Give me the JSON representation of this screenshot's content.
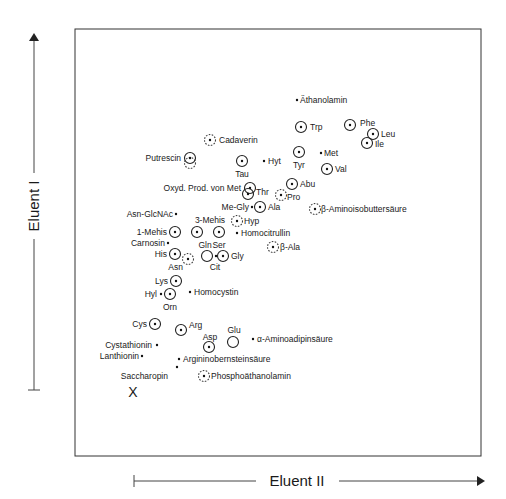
{
  "axes": {
    "y_label": "Eluent I",
    "x_label": "Eluent II"
  },
  "origin_marker": "X",
  "legend_symbols": {
    "solid-circle-dot": "circled spot (strong)",
    "dashed-circle-dot": "dashed circled spot (weak)",
    "open-circle": "open circle",
    "dot": "small dot"
  },
  "chart_data": {
    "type": "scatter",
    "title": "",
    "xlabel": "Eluent II",
    "ylabel": "Eluent I",
    "grid": false,
    "points": [
      {
        "name": "Äthanolamin",
        "x": 297,
        "y": 100,
        "marker": "dot",
        "lx": 300,
        "ly": 103,
        "anchor": "start"
      },
      {
        "name": "Trp",
        "x": 301,
        "y": 127,
        "marker": "circle-dot",
        "lx": 310,
        "ly": 130,
        "anchor": "start"
      },
      {
        "name": "Phe",
        "x": 350,
        "y": 125,
        "marker": "circle-dot",
        "lx": 360,
        "ly": 126,
        "anchor": "start"
      },
      {
        "name": "Leu",
        "x": 373,
        "y": 134,
        "marker": "circle-dot",
        "lx": 381,
        "ly": 137,
        "anchor": "start"
      },
      {
        "name": "Ile",
        "x": 367,
        "y": 143,
        "marker": "circle-dot",
        "lx": 375,
        "ly": 147,
        "anchor": "start"
      },
      {
        "name": "Cadaverin",
        "x": 210,
        "y": 140,
        "marker": "dashed-circle-dot",
        "lx": 219,
        "ly": 143,
        "anchor": "start"
      },
      {
        "name": "Putrescin",
        "x": 190,
        "y": 158,
        "marker": "circle-dot",
        "lx": 181,
        "ly": 161,
        "anchor": "end"
      },
      {
        "name": "Tau",
        "x": 242,
        "y": 161,
        "marker": "circle-dot",
        "lx": 242,
        "ly": 177,
        "anchor": "middle"
      },
      {
        "name": "Hyt",
        "x": 264,
        "y": 161,
        "marker": "dot",
        "lx": 268,
        "ly": 164,
        "anchor": "start"
      },
      {
        "name": "Tyr",
        "x": 299,
        "y": 152,
        "marker": "circle-dot",
        "lx": 299,
        "ly": 168,
        "anchor": "middle"
      },
      {
        "name": "Met",
        "x": 321,
        "y": 153,
        "marker": "dot",
        "lx": 324,
        "ly": 156,
        "anchor": "start"
      },
      {
        "name": "Val",
        "x": 327,
        "y": 169,
        "marker": "circle-dot",
        "lx": 335,
        "ly": 172,
        "anchor": "start"
      },
      {
        "name": "Oxyd. Prod. von Met",
        "x": 250,
        "y": 188,
        "marker": "circle-dot",
        "lx": 241,
        "ly": 191,
        "anchor": "end"
      },
      {
        "name": "Thr",
        "x": 248,
        "y": 194,
        "marker": "circle-dot",
        "lx": 256,
        "ly": 195,
        "anchor": "start"
      },
      {
        "name": "Abu",
        "x": 292,
        "y": 184,
        "marker": "circle-dot",
        "lx": 300,
        "ly": 187,
        "anchor": "start"
      },
      {
        "name": "Pro",
        "x": 281,
        "y": 195,
        "marker": "dashed-circle-dot",
        "lx": 287,
        "ly": 200,
        "anchor": "start"
      },
      {
        "name": "Me-Gly",
        "x": 252,
        "y": 207,
        "marker": "dot",
        "lx": 249,
        "ly": 210,
        "anchor": "end"
      },
      {
        "name": "Ala",
        "x": 260,
        "y": 207,
        "marker": "circle-dot",
        "lx": 268,
        "ly": 210,
        "anchor": "start"
      },
      {
        "name": "β-Aminoisobuttersäure",
        "x": 315,
        "y": 209,
        "marker": "dashed-circle-dot",
        "lx": 321,
        "ly": 212,
        "anchor": "start"
      },
      {
        "name": "Asn-GlcNAc",
        "x": 176,
        "y": 214,
        "marker": "dot",
        "lx": 173,
        "ly": 217,
        "anchor": "end"
      },
      {
        "name": "Hyp",
        "x": 237,
        "y": 221,
        "marker": "dashed-circle-dot",
        "lx": 244,
        "ly": 224,
        "anchor": "start"
      },
      {
        "name": "3-Mehis",
        "x": 197,
        "y": 232,
        "marker": "circle-dot",
        "lx": 210,
        "ly": 223,
        "anchor": "middle"
      },
      {
        "name": "Ser",
        "x": 219,
        "y": 232,
        "marker": "circle-dot",
        "lx": 219,
        "ly": 248,
        "anchor": "middle"
      },
      {
        "name": "Homocitrullin",
        "x": 237,
        "y": 233,
        "marker": "dot",
        "lx": 241,
        "ly": 236,
        "anchor": "start"
      },
      {
        "name": "1-Mehis",
        "x": 175,
        "y": 232,
        "marker": "circle-dot",
        "lx": 167,
        "ly": 235,
        "anchor": "end"
      },
      {
        "name": "Carnosin",
        "x": 168,
        "y": 243,
        "marker": "dot",
        "lx": 165,
        "ly": 246,
        "anchor": "end"
      },
      {
        "name": "β-Ala",
        "x": 273,
        "y": 247,
        "marker": "dashed-circle-dot",
        "lx": 280,
        "ly": 250,
        "anchor": "start"
      },
      {
        "name": "His",
        "x": 175,
        "y": 254,
        "marker": "circle-dot",
        "lx": 167,
        "ly": 257,
        "anchor": "end"
      },
      {
        "name": "Asn",
        "x": 188,
        "y": 259,
        "marker": "dashed-circle-dot",
        "lx": 183,
        "ly": 270,
        "anchor": "end"
      },
      {
        "name": "Gln",
        "x": 207,
        "y": 256,
        "marker": "open-circle",
        "lx": 205,
        "ly": 248,
        "anchor": "middle"
      },
      {
        "name": "Cit",
        "x": 216,
        "y": 256,
        "marker": "dot",
        "lx": 215,
        "ly": 270,
        "anchor": "middle"
      },
      {
        "name": "Gly",
        "x": 223,
        "y": 256,
        "marker": "circle-dot",
        "lx": 231,
        "ly": 259,
        "anchor": "start"
      },
      {
        "name": "Lys",
        "x": 176,
        "y": 281,
        "marker": "circle-dot",
        "lx": 168,
        "ly": 284,
        "anchor": "end"
      },
      {
        "name": "Hyl",
        "x": 161,
        "y": 294,
        "marker": "dot",
        "lx": 157,
        "ly": 297,
        "anchor": "end"
      },
      {
        "name": "Orn",
        "x": 170,
        "y": 294,
        "marker": "circle-dot",
        "lx": 170,
        "ly": 310,
        "anchor": "middle"
      },
      {
        "name": "Homocystin",
        "x": 190,
        "y": 292,
        "marker": "dot",
        "lx": 194,
        "ly": 295,
        "anchor": "start"
      },
      {
        "name": "Cys",
        "x": 155,
        "y": 324,
        "marker": "circle-dot",
        "lx": 147,
        "ly": 327,
        "anchor": "end"
      },
      {
        "name": "Arg",
        "x": 181,
        "y": 330,
        "marker": "circle-dot",
        "lx": 189,
        "ly": 328,
        "anchor": "start"
      },
      {
        "name": "Asp",
        "x": 209,
        "y": 347,
        "marker": "circle-dot",
        "lx": 210,
        "ly": 340,
        "anchor": "middle"
      },
      {
        "name": "Glu",
        "x": 233,
        "y": 342,
        "marker": "open-circle",
        "lx": 234,
        "ly": 333,
        "anchor": "middle"
      },
      {
        "name": "α-Aminoadipinsäure",
        "x": 253,
        "y": 339,
        "marker": "dot",
        "lx": 257,
        "ly": 342,
        "anchor": "start"
      },
      {
        "name": "Cystathionin",
        "x": 157,
        "y": 345,
        "marker": "dot",
        "lx": 152,
        "ly": 348,
        "anchor": "end"
      },
      {
        "name": "Lanthionin",
        "x": 142,
        "y": 356,
        "marker": "dot",
        "lx": 139,
        "ly": 359,
        "anchor": "end"
      },
      {
        "name": "Argininobernsteinsäure",
        "x": 179,
        "y": 359,
        "marker": "dot",
        "lx": 183,
        "ly": 362,
        "anchor": "start"
      },
      {
        "name": "Saccharopin",
        "x": 177,
        "y": 367,
        "marker": "dot",
        "lx": 168,
        "ly": 379,
        "anchor": "end"
      },
      {
        "name": "Phosphoäthanolamin",
        "x": 204,
        "y": 376,
        "marker": "dashed-circle-dot",
        "lx": 211,
        "ly": 379,
        "anchor": "start"
      }
    ]
  },
  "overlap_markers": [
    {
      "note": "dashed circle overlapping Putrescin",
      "x": 190,
      "y": 163,
      "marker": "dashed-circle"
    }
  ]
}
